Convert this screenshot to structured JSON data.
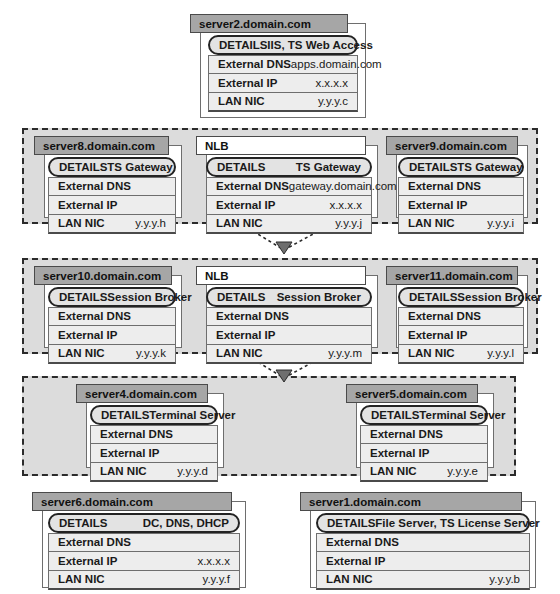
{
  "diagram": {
    "row_labels": {
      "details": "DETAILS",
      "external_dns": "External DNS",
      "external_ip": "External IP",
      "lan_nic": "LAN NIC"
    },
    "colors": {
      "title_bar": "#a6a6a6",
      "group_fill": "#dcdcdc",
      "group_border": "#2b2b2b",
      "row_fill": "#ededed",
      "details_fill": "#e3e3e3",
      "sheet_fill": "#ffffff",
      "border": "#6e6e6e"
    },
    "groups": [
      {
        "id": "group-gateway",
        "label": ""
      },
      {
        "id": "group-session-broker",
        "label": ""
      },
      {
        "id": "group-terminal-server",
        "label": ""
      }
    ],
    "cards": [
      {
        "id": "server2",
        "title": "server2.domain.com",
        "kind": "server",
        "details": "IIS, TS Web Access",
        "external_dns": "apps.domain.com",
        "external_ip": "x.x.x.x",
        "lan_nic": "y.y.y.c"
      },
      {
        "id": "server8",
        "title": "server8.domain.com",
        "kind": "server",
        "details": "TS Gateway",
        "external_dns": "",
        "external_ip": "",
        "lan_nic": "y.y.y.h"
      },
      {
        "id": "nlb-gateway",
        "title": "NLB",
        "kind": "nlb",
        "details": "TS Gateway",
        "external_dns": "gateway.domain.com",
        "external_ip": "x.x.x.x",
        "lan_nic": "y.y.y.j"
      },
      {
        "id": "server9",
        "title": "server9.domain.com",
        "kind": "server",
        "details": "TS Gateway",
        "external_dns": "",
        "external_ip": "",
        "lan_nic": "y.y.y.i"
      },
      {
        "id": "server10",
        "title": "server10.domain.com",
        "kind": "server",
        "details": "Session Broker",
        "external_dns": "",
        "external_ip": "",
        "lan_nic": "y.y.y.k"
      },
      {
        "id": "nlb-session-broker",
        "title": "NLB",
        "kind": "nlb",
        "details": "Session Broker",
        "external_dns": "",
        "external_ip": "",
        "lan_nic": "y.y.y.m"
      },
      {
        "id": "server11",
        "title": "server11.domain.com",
        "kind": "server",
        "details": "Session Broker",
        "external_dns": "",
        "external_ip": "",
        "lan_nic": "y.y.y.l"
      },
      {
        "id": "server4",
        "title": "server4.domain.com",
        "kind": "server",
        "details": "Terminal Server",
        "external_dns": "",
        "external_ip": "",
        "lan_nic": "y.y.y.d"
      },
      {
        "id": "server5",
        "title": "server5.domain.com",
        "kind": "server",
        "details": "Terminal Server",
        "external_dns": "",
        "external_ip": "",
        "lan_nic": "y.y.y.e"
      },
      {
        "id": "server6",
        "title": "server6.domain.com",
        "kind": "server",
        "details": "DC, DNS, DHCP",
        "external_dns": "",
        "external_ip": "x.x.x.x",
        "lan_nic": "y.y.y.f"
      },
      {
        "id": "server1",
        "title": "server1.domain.com",
        "kind": "server",
        "details": "File Server, TS License Server",
        "external_dns": "",
        "external_ip": "",
        "lan_nic": "y.y.y.b"
      }
    ],
    "connectors": [
      {
        "id": "arrow-gateway-to-broker",
        "from": "group-gateway",
        "to": "group-session-broker"
      },
      {
        "id": "arrow-broker-to-terminal",
        "from": "group-session-broker",
        "to": "group-terminal-server"
      }
    ]
  }
}
